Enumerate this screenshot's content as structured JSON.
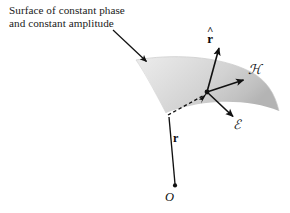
{
  "figure": {
    "caption": {
      "line1": "Surface of constant phase",
      "line2": "and constant amplitude"
    },
    "labels": {
      "unit_radial_hat": "^",
      "unit_radial_base": "r",
      "magnetic_field": "ℋ",
      "electric_field": "ℰ",
      "position_vector": "r",
      "origin": "O"
    },
    "colors": {
      "background": "#ffffff",
      "surface_light": "#e8e8e8",
      "surface_mid": "#d2d2d2",
      "surface_dark": "#b6b6b6",
      "stroke": "#111111",
      "text": "#1a1a1a"
    },
    "geometry": {
      "origin_point": [
        174,
        186
      ],
      "field_point": [
        207,
        92
      ],
      "rhat_tip": [
        219,
        47
      ],
      "h_tip": [
        243,
        80
      ],
      "e_tip": [
        233,
        116
      ],
      "callout_from": [
        113,
        30
      ],
      "callout_to": [
        146,
        61
      ]
    }
  }
}
